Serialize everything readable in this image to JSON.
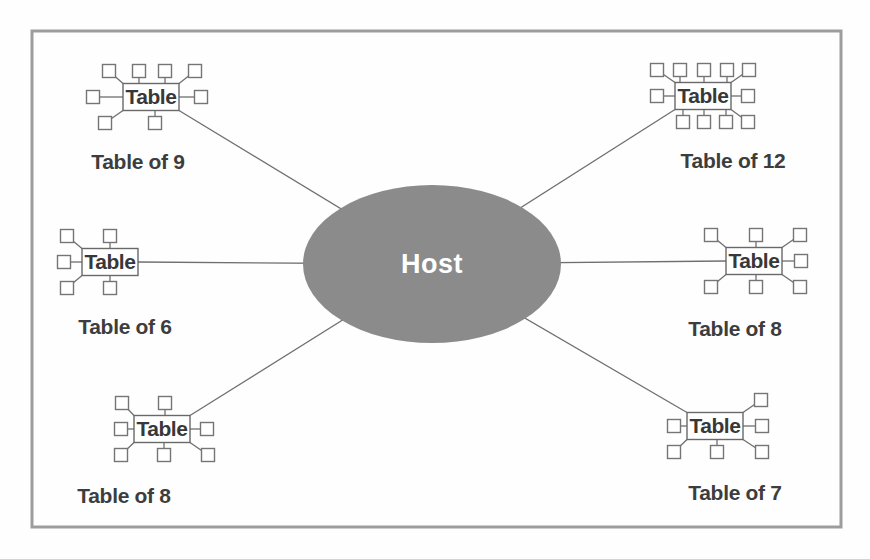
{
  "diagram": {
    "host": {
      "label": "Host",
      "cx": 432,
      "cy": 264,
      "rx": 129,
      "ry": 79,
      "fill": "#8b8b8b",
      "label_color": "#ffffff"
    },
    "node_box_label": "Table",
    "tables": [
      {
        "id": "top-left",
        "caption": "Table of 9",
        "cx": 151,
        "cy": 97,
        "label_x": 138,
        "label_y": 169,
        "seats_top": [
          -42,
          -12,
          14,
          44
        ],
        "seats_bottom": [
          -46,
          4
        ],
        "seat_left": -58,
        "seat_right": 50,
        "link": "br"
      },
      {
        "id": "top-right",
        "caption": "Table of 12",
        "cx": 703,
        "cy": 96,
        "label_x": 733,
        "label_y": 168,
        "seats_top": [
          -46,
          -23,
          1,
          24,
          46
        ],
        "seats_bottom": [
          -20,
          1,
          23,
          45
        ],
        "seat_left": -46,
        "seat_right": 45,
        "link": "bl"
      },
      {
        "id": "middle-left",
        "caption": "Table of 6",
        "cx": 110,
        "cy": 262,
        "label_x": 125,
        "label_y": 334,
        "seats_top": [
          -43,
          0
        ],
        "seats_bottom": [
          -43,
          0
        ],
        "seat_left": -46,
        "seat_right": null,
        "link": "r"
      },
      {
        "id": "middle-right",
        "caption": "Table of 8",
        "cx": 754,
        "cy": 261,
        "label_x": 735,
        "label_y": 336,
        "seats_top": [
          -43,
          2,
          46
        ],
        "seats_bottom": [
          -43,
          2,
          46
        ],
        "seat_left": null,
        "seat_right": 47,
        "link": "l"
      },
      {
        "id": "bottom-left",
        "caption": "Table of 8",
        "cx": 162,
        "cy": 429,
        "label_x": 124,
        "label_y": 503,
        "seats_top": [
          -40,
          3
        ],
        "seats_bottom": [
          -41,
          2,
          46
        ],
        "seat_left": -41,
        "seat_right": 45,
        "link": "tr"
      },
      {
        "id": "bottom-right",
        "caption": "Table of 7",
        "cx": 715,
        "cy": 426,
        "label_x": 735,
        "label_y": 500,
        "seats_top": [
          46
        ],
        "seats_bottom": [
          -41,
          2,
          47
        ],
        "seat_left": -41,
        "seat_right": 47,
        "link": "tl"
      }
    ]
  }
}
